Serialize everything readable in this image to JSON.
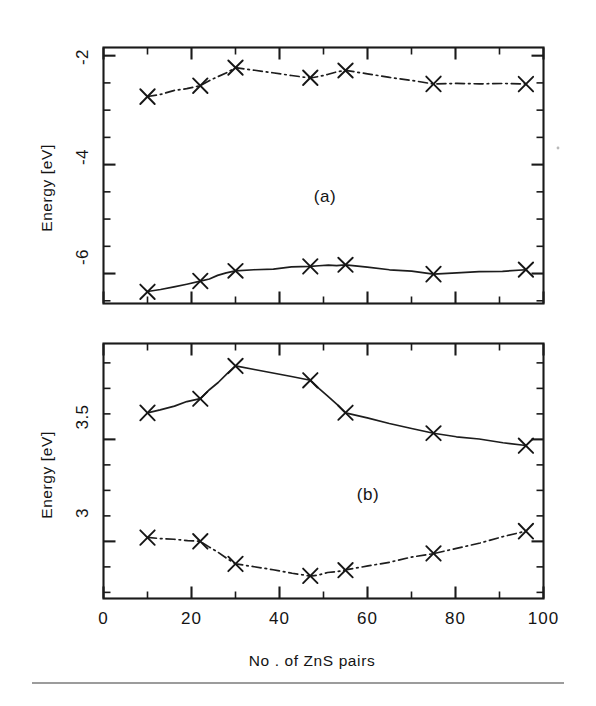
{
  "figure": {
    "background_color": "#ffffff",
    "ink_color": "#1a1a1a",
    "x_axis_title": "No . of ZnS pairs",
    "panels": [
      {
        "tag": "(a)",
        "y_axis_title": "Energy [eV]",
        "y_tick_labels": [
          "-2",
          "-4",
          "-6"
        ]
      },
      {
        "tag": "(b)",
        "y_axis_title": "Energy [eV]",
        "y_tick_labels": [
          "3.5",
          "3"
        ]
      }
    ],
    "x_tick_labels": [
      "0",
      "20",
      "40",
      "60",
      "80",
      "100"
    ]
  },
  "chart_data": [
    {
      "type": "line",
      "panel": "(a)",
      "title": "",
      "xlabel": "No . of ZnS pairs",
      "ylabel": "Energy [eV]",
      "xlim": [
        0,
        100
      ],
      "ylim": [
        -6.55,
        -1.85
      ],
      "xticks": [
        0,
        20,
        40,
        60,
        80,
        100
      ],
      "xticks_minor": [
        10,
        30,
        50,
        70,
        90
      ],
      "yticks": [
        -2,
        -4,
        -6
      ],
      "yticks_minor": [
        -2.5,
        -3,
        -3.5,
        -4.5,
        -5,
        -5.5,
        -6.5
      ],
      "grid": false,
      "legend": "none",
      "marker": "x",
      "series": [
        {
          "name": "upper-curve",
          "linestyle": "dashdot",
          "x": [
            10,
            22,
            30,
            47,
            55,
            75,
            96
          ],
          "y": [
            -2.75,
            -2.55,
            -2.22,
            -2.41,
            -2.27,
            -2.52,
            -2.52
          ]
        },
        {
          "name": "lower-curve",
          "linestyle": "solid",
          "x": [
            10,
            22,
            30,
            47,
            55,
            75,
            96
          ],
          "y": [
            -6.33,
            -6.14,
            -5.95,
            -5.87,
            -5.84,
            -6.01,
            -5.93
          ]
        }
      ]
    },
    {
      "type": "line",
      "panel": "(b)",
      "title": "",
      "xlabel": "No . of ZnS pairs",
      "ylabel": "Energy [eV]",
      "xlim": [
        0,
        100
      ],
      "ylim": [
        2.72,
        3.97
      ],
      "xticks": [
        0,
        20,
        40,
        60,
        80,
        100
      ],
      "xticks_minor": [
        10,
        30,
        50,
        70,
        90
      ],
      "yticks": [
        3.5,
        3
      ],
      "yticks_minor": [
        2.75,
        2.875,
        3.125,
        3.25,
        3.375,
        3.625,
        3.75,
        3.875
      ],
      "grid": false,
      "legend": "none",
      "marker": "x",
      "series": [
        {
          "name": "upper-curve",
          "linestyle": "solid",
          "x": [
            10,
            22,
            30,
            47,
            55,
            75,
            96
          ],
          "y": [
            3.63,
            3.7,
            3.86,
            3.79,
            3.63,
            3.53,
            3.47
          ]
        },
        {
          "name": "lower-curve",
          "linestyle": "dashdot",
          "x": [
            10,
            22,
            30,
            47,
            55,
            75,
            96
          ],
          "y": [
            3.02,
            3.0,
            2.89,
            2.83,
            2.86,
            2.94,
            3.05
          ]
        }
      ]
    }
  ]
}
